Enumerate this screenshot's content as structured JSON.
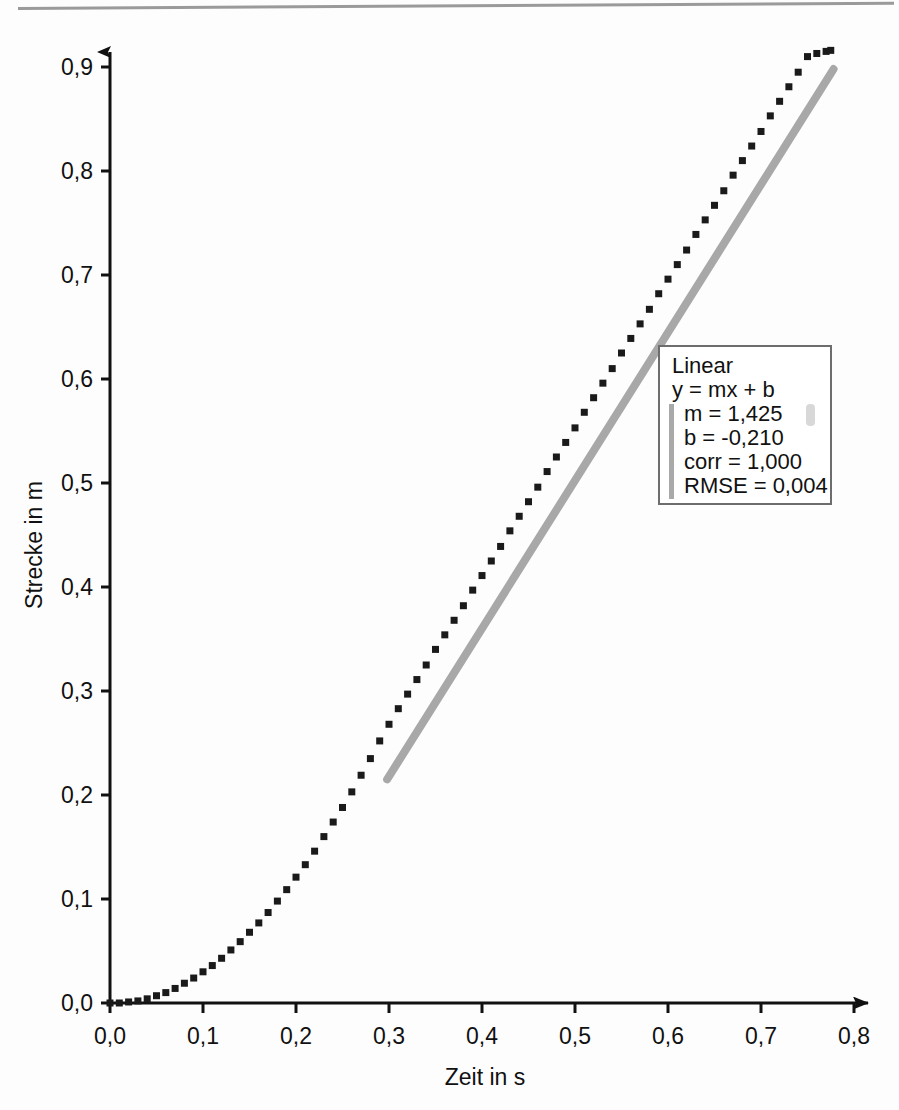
{
  "chart_data": {
    "type": "scatter",
    "title": "",
    "xlabel": "Zeit in s",
    "ylabel": "Strecke in m",
    "xlim": [
      0.0,
      0.84
    ],
    "ylim": [
      0.0,
      0.935
    ],
    "xticks": [
      "0,0",
      "0,1",
      "0,2",
      "0,3",
      "0,4",
      "0,5",
      "0,6",
      "0,7",
      "0,8"
    ],
    "xtick_values": [
      0.0,
      0.1,
      0.2,
      0.3,
      0.4,
      0.5,
      0.6,
      0.7,
      0.8
    ],
    "yticks": [
      "0,0",
      "0,1",
      "0,2",
      "0,3",
      "0,4",
      "0,5",
      "0,6",
      "0,7",
      "0,8",
      "0,9"
    ],
    "ytick_values": [
      0.0,
      0.1,
      0.2,
      0.3,
      0.4,
      0.5,
      0.6,
      0.7,
      0.8,
      0.9
    ],
    "grid": false,
    "legend_position": "inside-right",
    "series": [
      {
        "name": "Messpunkte",
        "type": "scatter",
        "marker": "square",
        "color": "#1a1a1a",
        "x": [
          0.0,
          0.01,
          0.02,
          0.03,
          0.04,
          0.05,
          0.06,
          0.07,
          0.08,
          0.09,
          0.1,
          0.11,
          0.12,
          0.13,
          0.14,
          0.15,
          0.16,
          0.17,
          0.18,
          0.19,
          0.2,
          0.21,
          0.22,
          0.23,
          0.24,
          0.25,
          0.26,
          0.27,
          0.28,
          0.29,
          0.3,
          0.31,
          0.32,
          0.33,
          0.34,
          0.35,
          0.36,
          0.37,
          0.38,
          0.39,
          0.4,
          0.41,
          0.42,
          0.43,
          0.44,
          0.45,
          0.46,
          0.47,
          0.48,
          0.49,
          0.5,
          0.51,
          0.52,
          0.53,
          0.54,
          0.55,
          0.56,
          0.57,
          0.58,
          0.59,
          0.6,
          0.61,
          0.62,
          0.63,
          0.64,
          0.65,
          0.66,
          0.67,
          0.68,
          0.69,
          0.7,
          0.71,
          0.72,
          0.73,
          0.74,
          0.75,
          0.76,
          0.77,
          0.775
        ],
        "y": [
          0.0,
          0.0,
          0.001,
          0.002,
          0.004,
          0.007,
          0.01,
          0.014,
          0.019,
          0.024,
          0.03,
          0.036,
          0.043,
          0.051,
          0.059,
          0.068,
          0.077,
          0.087,
          0.098,
          0.109,
          0.121,
          0.133,
          0.146,
          0.16,
          0.174,
          0.188,
          0.203,
          0.219,
          0.235,
          0.252,
          0.268,
          0.283,
          0.297,
          0.311,
          0.325,
          0.34,
          0.354,
          0.368,
          0.382,
          0.397,
          0.411,
          0.425,
          0.439,
          0.454,
          0.468,
          0.482,
          0.496,
          0.511,
          0.525,
          0.539,
          0.553,
          0.568,
          0.582,
          0.596,
          0.61,
          0.625,
          0.639,
          0.653,
          0.667,
          0.682,
          0.696,
          0.71,
          0.724,
          0.739,
          0.753,
          0.767,
          0.781,
          0.796,
          0.81,
          0.824,
          0.838,
          0.853,
          0.867,
          0.881,
          0.895,
          0.91,
          0.913,
          0.915,
          0.916
        ]
      },
      {
        "name": "Linear fit",
        "type": "line",
        "color": "#a8a8a8",
        "x_start": 0.298,
        "x_end": 0.778,
        "y_start": 0.215,
        "y_end": 0.898
      }
    ]
  },
  "legend": {
    "title": "Linear",
    "equation": "y = mx + b",
    "params": [
      "m = 1,425",
      "b = -0,210",
      "corr = 1,000",
      "RMSE = 0,004"
    ]
  }
}
